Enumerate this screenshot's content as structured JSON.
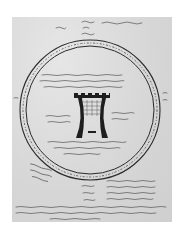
{
  "document": {
    "type": "scanned medieval manuscript page",
    "script": "handwritten (illegible at this resolution)",
    "colors": {
      "paper": "#dcdcdc",
      "ink": "#2a2a2a",
      "background": "#ffffff"
    }
  },
  "diagram": {
    "outer_ring": {
      "cx": 90,
      "cy": 110,
      "r": 70
    },
    "inner_ring": {
      "cx": 90,
      "cy": 110,
      "r": 64
    },
    "ring_text": "illegible handwritten inscription around ring",
    "center_figure": "tower with battlements"
  },
  "regions": [
    {
      "name": "top-annotations",
      "text": "illegible handwritten notes"
    },
    {
      "name": "inner-upper-text",
      "text": "illegible handwritten lines"
    },
    {
      "name": "inner-left-text",
      "text": "illegible handwritten lines"
    },
    {
      "name": "inner-right-text",
      "text": "illegible handwritten lines"
    },
    {
      "name": "inner-lower-text",
      "text": "illegible handwritten lines"
    },
    {
      "name": "lower-left-note",
      "text": "illegible handwritten note"
    },
    {
      "name": "lower-table",
      "text": "illegible handwritten table"
    },
    {
      "name": "bottom-paragraph",
      "text": "illegible handwritten lines"
    }
  ]
}
